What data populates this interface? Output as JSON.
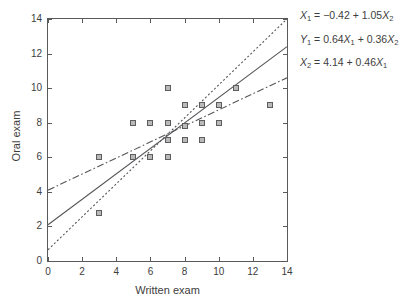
{
  "chart_data": {
    "type": "scatter",
    "title": "",
    "xlabel": "Written exam",
    "ylabel": "Oral exam",
    "xlim": [
      0,
      14
    ],
    "ylim": [
      0,
      14
    ],
    "xticks": [
      0,
      2,
      4,
      6,
      8,
      10,
      12,
      14
    ],
    "yticks": [
      0,
      2,
      4,
      6,
      8,
      10,
      12,
      14
    ],
    "grid": false,
    "legend": "none",
    "points": [
      {
        "x": 3,
        "y": 6
      },
      {
        "x": 3,
        "y": 2.8
      },
      {
        "x": 5,
        "y": 8
      },
      {
        "x": 5,
        "y": 6
      },
      {
        "x": 6,
        "y": 8
      },
      {
        "x": 6,
        "y": 6
      },
      {
        "x": 7,
        "y": 10
      },
      {
        "x": 7,
        "y": 8
      },
      {
        "x": 7,
        "y": 7
      },
      {
        "x": 7,
        "y": 6
      },
      {
        "x": 8,
        "y": 9
      },
      {
        "x": 8,
        "y": 7.8
      },
      {
        "x": 8,
        "y": 7
      },
      {
        "x": 9,
        "y": 9
      },
      {
        "x": 9,
        "y": 8
      },
      {
        "x": 9,
        "y": 7
      },
      {
        "x": 10,
        "y": 9
      },
      {
        "x": 10,
        "y": 8
      },
      {
        "x": 11,
        "y": 10
      },
      {
        "x": 13,
        "y": 9
      }
    ],
    "lines": [
      {
        "name": "regression-solid",
        "style": "solid",
        "intercept": 2.1,
        "slope": 0.736,
        "x0": 0,
        "y0": 2.1,
        "x1": 14,
        "y1": 12.4
      },
      {
        "name": "regression-dotted",
        "style": "dotted",
        "intercept": 0.65,
        "slope": 0.954,
        "x0": 0,
        "y0": 0.65,
        "x1": 14,
        "y1": 14.0
      },
      {
        "name": "regression-dashdot",
        "style": "dashdot",
        "intercept": 4.1,
        "slope": 0.464,
        "x0": 0,
        "y0": 4.1,
        "x1": 14,
        "y1": 10.6
      }
    ],
    "annotations": [
      {
        "id": "eq1",
        "text": "X1 = -0.42 + 1.05X2",
        "lhs": "X",
        "lhs_sub": "1",
        "rhs": "= −0.42 + 1.05",
        "rhs_var": "X",
        "rhs_sub": "2"
      },
      {
        "id": "eq2",
        "text": "Y1 = 0.64X1 + 0.36X2"
      },
      {
        "id": "eq3",
        "text": "X2 = 4.14 + 0.46X1"
      }
    ]
  },
  "axes": {
    "x_title": "Written exam",
    "y_title": "Oral exam",
    "x_ticklabels": [
      "0",
      "2",
      "4",
      "6",
      "8",
      "10",
      "12",
      "14"
    ],
    "y_ticklabels": [
      "0",
      "2",
      "4",
      "6",
      "8",
      "10",
      "12",
      "14"
    ]
  },
  "equations": [
    {
      "parts": [
        {
          "t": "X",
          "italic": true
        },
        {
          "t": "1",
          "sub": true
        },
        {
          "t": " = −0.42 + 1.05"
        },
        {
          "t": "X",
          "italic": true
        },
        {
          "t": "2",
          "sub": true
        }
      ]
    },
    {
      "parts": [
        {
          "t": "Y",
          "italic": true
        },
        {
          "t": "1",
          "sub": true
        },
        {
          "t": " = 0.64"
        },
        {
          "t": "X",
          "italic": true
        },
        {
          "t": "1",
          "sub": true
        },
        {
          "t": " + 0.36"
        },
        {
          "t": "X",
          "italic": true
        },
        {
          "t": "2",
          "sub": true
        }
      ]
    },
    {
      "parts": [
        {
          "t": "X",
          "italic": true
        },
        {
          "t": "2",
          "sub": true
        },
        {
          "t": " = 4.14 + 0.46"
        },
        {
          "t": "X",
          "italic": true
        },
        {
          "t": "1",
          "sub": true
        }
      ]
    }
  ],
  "colors": {
    "axis": "#5a5a5a",
    "text": "#3d3d3d",
    "marker_fill": "#b9b9b9",
    "marker_edge": "#5d5d5d",
    "line": "#55565a",
    "background": "#ffffff"
  }
}
